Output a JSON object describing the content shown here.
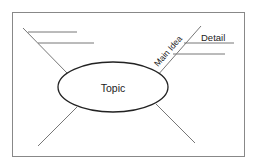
{
  "diagram": {
    "type": "mind-map",
    "center": {
      "label": "Topic"
    },
    "branches": [
      {
        "position": "upper-left",
        "label": "",
        "details": [
          "",
          ""
        ]
      },
      {
        "position": "upper-right",
        "label": "Main Idea",
        "details": [
          "Detail",
          ""
        ]
      },
      {
        "position": "lower-left",
        "label": "",
        "details": []
      },
      {
        "position": "lower-right",
        "label": "",
        "details": []
      }
    ]
  },
  "colors": {
    "frame": "#777777",
    "ellipse": "#222222",
    "lines": "#777777",
    "text": "#222222",
    "background": "#ffffff"
  }
}
